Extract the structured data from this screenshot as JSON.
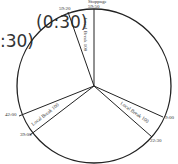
{
  "legend": {
    "line1": "(0:30)",
    "line2": ":30)"
  },
  "clock": {
    "center": [
      94,
      86
    ],
    "radius": 77,
    "stroke_color": "#222222",
    "top_caption": "Stoppage",
    "markers": [
      {
        "label": "59:50",
        "x": 94,
        "y": 9
      },
      {
        "label": "59:20",
        "x": 68,
        "y": 12
      },
      {
        "label": "9:00",
        "x": 163,
        "y": 117
      },
      {
        "label": "22:30",
        "x": 152,
        "y": 137
      },
      {
        "label": "42:00",
        "x": 19,
        "y": 116
      },
      {
        "label": "39:00",
        "x": 30,
        "y": 135
      }
    ],
    "segments": [
      {
        "label": "Local Break 100",
        "position": "top"
      },
      {
        "label": "Local Break 100",
        "position": "right"
      },
      {
        "label": "Local Break 100",
        "position": "left"
      }
    ]
  }
}
